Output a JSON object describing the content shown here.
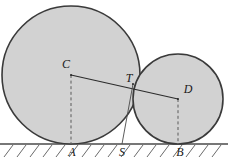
{
  "figure": {
    "width": 228,
    "height": 161,
    "background": "#ffffff"
  },
  "style": {
    "circle_fill": "#d2d2d2",
    "circle_stroke": "#3a3a3a",
    "circle_stroke_width": 1.6,
    "ground_color": "#4a4a4a",
    "ground_width": 1.6,
    "hatch_color": "#6a6a6a",
    "hatch_width": 1,
    "solid_line_color": "#2b2b2b",
    "dashed_line_color": "#5a5a5a",
    "thin_line_color": "#4a4a4a",
    "label_color": "#1a1a1a",
    "label_font_size": 12
  },
  "geometry": {
    "ground_y": 144,
    "circles": [
      {
        "name": "large-circle",
        "center_label": "C",
        "cx": 71,
        "cy": 75,
        "r": 69
      },
      {
        "name": "small-circle",
        "center_label": "D",
        "cx": 178,
        "cy": 99,
        "r": 45
      }
    ],
    "points": [
      {
        "id": "C",
        "label": "C",
        "x": 71,
        "y": 75,
        "label_x": 66,
        "label_y": 65
      },
      {
        "id": "T",
        "label": "T",
        "x": 133,
        "y": 84,
        "label_x": 129,
        "label_y": 79
      },
      {
        "id": "D",
        "label": "D",
        "x": 178,
        "y": 99,
        "label_x": 188,
        "label_y": 90
      },
      {
        "id": "A",
        "label": "A",
        "x": 71,
        "y": 144,
        "label_x": 72,
        "label_y": 153
      },
      {
        "id": "S",
        "label": "S",
        "x": 122,
        "y": 144,
        "label_x": 122,
        "label_y": 153
      },
      {
        "id": "B",
        "label": "B",
        "x": 178,
        "y": 144,
        "label_x": 180,
        "label_y": 153
      }
    ],
    "segments": [
      {
        "name": "segment-CD",
        "from": "C",
        "to": "D",
        "style": "solid"
      },
      {
        "name": "segment-CA",
        "from": "C",
        "to": "A",
        "style": "dashed"
      },
      {
        "name": "segment-DB",
        "from": "D",
        "to": "B",
        "style": "dashed"
      },
      {
        "name": "segment-TS",
        "from": "T",
        "to": "S",
        "style": "thin"
      }
    ],
    "hatching": {
      "x_start": 4,
      "x_end": 224,
      "depth": 13,
      "spacing": 13,
      "slope_dx": 9
    }
  },
  "labels": {
    "C": "C",
    "T": "T",
    "D": "D",
    "A": "A",
    "S": "S",
    "B": "B"
  }
}
